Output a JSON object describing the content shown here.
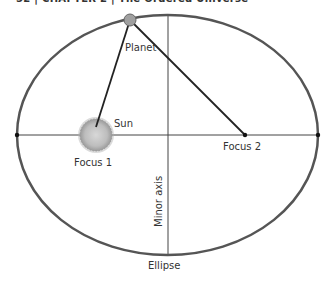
{
  "page": {
    "running_head": "52 | CHAPTER 2 | The Ordered Universe"
  },
  "diagram": {
    "labels": {
      "planet": "Planet",
      "sun": "Sun",
      "focus1": "Focus 1",
      "focus2": "Focus 2",
      "minor_axis": "Minor axis",
      "ellipse": "Ellipse"
    },
    "geometry": {
      "ellipse_center": [
        167.5,
        135
      ],
      "ellipse_rx": 150.5,
      "ellipse_ry": 120,
      "focus1": [
        96,
        135
      ],
      "focus2": [
        245,
        135
      ],
      "planet": [
        130,
        20
      ],
      "sun_radius": 16
    },
    "colors": {
      "ellipse_stroke": "#555555",
      "line": "#222222",
      "axis": "#444444",
      "planet_fill": "#a0a0a0",
      "sun_fill": "#c8c8c8",
      "text": "#333333"
    }
  }
}
